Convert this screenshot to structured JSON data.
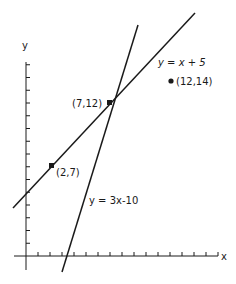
{
  "figure": {
    "axes": {
      "x_label": "x",
      "y_label": "y"
    },
    "lines": [
      {
        "id": "line1",
        "equation_label": "y = x + 5",
        "slope": 1,
        "intercept": 5
      },
      {
        "id": "line2",
        "equation_label": "y = 3x-10",
        "slope": 3,
        "intercept": -10
      }
    ],
    "points": [
      {
        "id": "p1",
        "label": "(2,7)",
        "x": 2,
        "y": 7
      },
      {
        "id": "p2",
        "label": "(7,12)",
        "x": 7,
        "y": 12
      },
      {
        "id": "p3",
        "label": "(12,14)",
        "x": 12,
        "y": 14
      }
    ],
    "ticks": {
      "x_count": 16,
      "y_count": 15
    },
    "colors": {
      "ink": "#1a1a1a",
      "background": "#ffffff"
    }
  }
}
